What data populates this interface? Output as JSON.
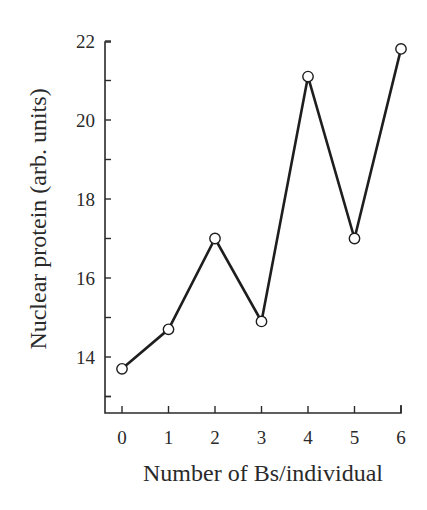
{
  "chart_data": {
    "type": "line",
    "title": "",
    "xlabel": "Number of Bs/individual",
    "ylabel": "Nuclear protein (arb. units)",
    "categories": [
      "0",
      "1",
      "2",
      "3",
      "4",
      "5",
      "6"
    ],
    "x": [
      0,
      1,
      2,
      3,
      4,
      5,
      6
    ],
    "series": [
      {
        "name": "Nuclear protein",
        "values": [
          13.7,
          14.7,
          17.0,
          14.9,
          21.1,
          17.0,
          21.8
        ],
        "marker": "open-circle",
        "color": "#1e1e1e"
      }
    ],
    "xlim": [
      -0.35,
      6
    ],
    "ylim": [
      12.6,
      22
    ],
    "yticks_major": [
      14,
      16,
      18,
      20,
      22
    ],
    "yticks_minor": [
      13,
      15,
      17,
      19,
      21
    ],
    "ytick_labels": [
      "14",
      "16",
      "18",
      "20",
      "22"
    ],
    "xtick_labels": [
      "0",
      "1",
      "2",
      "3",
      "4",
      "5",
      "6"
    ],
    "grid": false,
    "legend": "none"
  }
}
